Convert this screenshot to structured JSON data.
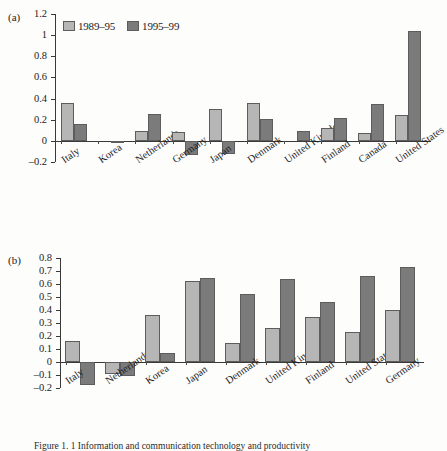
{
  "figure": {
    "caption": "Figure 1. 1 Information and communication technology and productivity"
  },
  "legend": {
    "position": "top-left-inside",
    "items": [
      {
        "label": "1989–95",
        "color": "#b6b6b6"
      },
      {
        "label": "1995–99",
        "color": "#7b7b7b"
      }
    ]
  },
  "chart_data": [
    {
      "type": "bar",
      "panel_label": "(a)",
      "title": "",
      "xlabel": "",
      "ylabel": "",
      "ylim": [
        -0.2,
        1.2
      ],
      "yticks": [
        -0.2,
        0,
        0.2,
        0.4,
        0.6,
        0.8,
        1,
        1.2
      ],
      "ytick_labels": [
        "–0.2",
        "0",
        "0.2",
        "0.4",
        "0.6",
        "0.8",
        "1",
        "1.2"
      ],
      "grid": false,
      "legend": [
        "1989–95",
        "1995–99"
      ],
      "categories": [
        "Italy",
        "Korea",
        "Netherlands",
        "Germany",
        "Japan",
        "Denmark",
        "United Kingdom",
        "Finland",
        "Canada",
        "United States"
      ],
      "series": [
        {
          "name": "1989–95",
          "color": "#b6b6b6",
          "values": [
            0.36,
            0.0,
            0.09,
            0.08,
            0.3,
            0.36,
            0.0,
            0.12,
            0.07,
            0.24
          ]
        },
        {
          "name": "1995–99",
          "color": "#7b7b7b",
          "values": [
            0.16,
            -0.02,
            0.25,
            -0.13,
            -0.12,
            0.21,
            0.09,
            0.22,
            0.35,
            1.04
          ]
        }
      ]
    },
    {
      "type": "bar",
      "panel_label": "(b)",
      "title": "",
      "xlabel": "",
      "ylabel": "",
      "ylim": [
        -0.2,
        0.8
      ],
      "yticks": [
        -0.2,
        -0.1,
        0,
        0.1,
        0.2,
        0.3,
        0.4,
        0.5,
        0.6,
        0.7,
        0.8
      ],
      "ytick_labels": [
        "–0.2",
        "–0.1",
        "0",
        "0.1",
        "0.2",
        "0.3",
        "0.4",
        "0.5",
        "0.6",
        "0.7",
        "0.8"
      ],
      "grid": false,
      "legend": [
        "1989–95",
        "1995–99"
      ],
      "categories": [
        "Italy",
        "Netherlands",
        "Korea",
        "Japan",
        "Denmark",
        "United Kingdom",
        "Finland",
        "United States",
        "Germany"
      ],
      "series": [
        {
          "name": "1989–95",
          "color": "#b6b6b6",
          "values": [
            0.16,
            -0.09,
            0.36,
            0.62,
            0.15,
            0.26,
            0.35,
            0.23,
            0.4
          ]
        },
        {
          "name": "1995–99",
          "color": "#7b7b7b",
          "values": [
            -0.18,
            -0.11,
            0.07,
            0.65,
            0.52,
            0.64,
            0.46,
            0.66,
            0.73
          ]
        }
      ]
    }
  ]
}
